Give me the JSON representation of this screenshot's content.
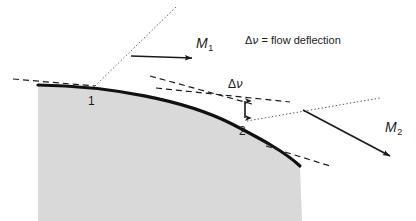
{
  "figure": {
    "type": "technical-diagram",
    "background_color": "#ffffff",
    "body_fill_color": "#d9d9d9",
    "line_color": "#1a1a1a"
  },
  "labels": {
    "mach_upstream": "M",
    "mach_upstream_sub": "1",
    "mach_downstream": "M",
    "mach_downstream_sub": "2",
    "deflection_symbol_delta": "Δ",
    "deflection_symbol_nu": "ν",
    "caption_equals": " = flow deflection",
    "point_one": "1",
    "point_two": "2"
  },
  "annotations": {
    "caption_full": "Δν = flow deflection",
    "angle_marker": "Δν"
  },
  "geometry": {
    "surface_start": [
      38,
      85
    ],
    "point_one": [
      95,
      86
    ],
    "point_two": [
      247,
      121
    ],
    "surface_end": [
      300,
      165
    ],
    "mach_line_1": [
      [
        95,
        86
      ],
      [
        176,
        7
      ]
    ],
    "mach_line_2": [
      [
        247,
        121
      ],
      [
        380,
        98
      ]
    ],
    "arrow_m1": [
      [
        131,
        56
      ],
      [
        192,
        58
      ]
    ],
    "arrow_m2": [
      [
        303,
        110
      ],
      [
        390,
        156
      ]
    ],
    "deflection_arrow": [
      [
        245,
        97
      ],
      [
        245,
        121
      ]
    ]
  }
}
